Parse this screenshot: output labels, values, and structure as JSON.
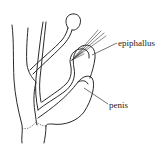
{
  "figure": {
    "type": "anatomical line drawing",
    "labels": {
      "epiphallus": "epiphallus",
      "penis": "penis"
    },
    "colors": {
      "line": "#2a2a2a",
      "background": "#ffffff"
    }
  }
}
